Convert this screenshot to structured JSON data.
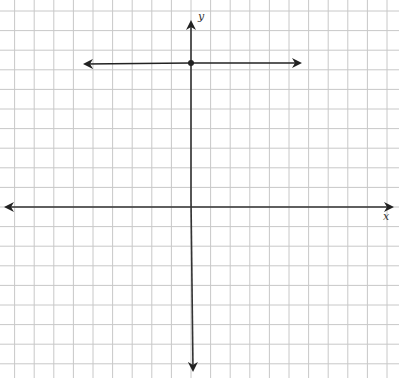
{
  "graph": {
    "x_axis_label": "x",
    "y_axis_label": "y",
    "grid": {
      "spacing_px": 19.6,
      "origin_px": [
        191,
        207
      ],
      "color": "#c8c8c8"
    },
    "axes_color": "#333333",
    "line": {
      "type": "horizontal",
      "equation_y": 7,
      "arrows": "both",
      "from_x": -5.5,
      "to_x": 5.5
    },
    "point": {
      "x": 0,
      "y": 7
    }
  }
}
